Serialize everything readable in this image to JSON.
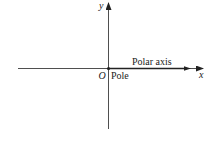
{
  "diagram": {
    "type": "polar-coordinate-axes",
    "labels": {
      "y_axis": "y",
      "x_axis": "x",
      "origin": "O",
      "pole": "Pole",
      "polar_axis": "Polar axis"
    },
    "colors": {
      "line": "#222222",
      "background": "#ffffff"
    }
  }
}
